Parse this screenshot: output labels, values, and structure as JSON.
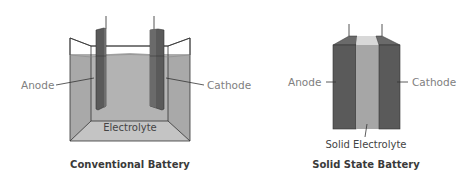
{
  "conventional": {
    "title": "Conventional Battery",
    "anode_label": "Anode",
    "cathode_label": "Cathode",
    "electrolyte_label": "Electrolyte"
  },
  "solid_state": {
    "title": "Solid State Battery",
    "anode_label": "Anode",
    "cathode_label": "Cathode",
    "electrolyte_label": "Solid Electrolyte"
  },
  "colors": {
    "electrode": "#5a5a5a",
    "electrode_light": "#6e6e6e",
    "electrolyte_liquid": "#a9a9a9",
    "electrolyte_floor": "#c4c4c4",
    "solid_electrolyte": "#a6a6a6",
    "outline": "#333333",
    "label_gray": "#808080"
  }
}
